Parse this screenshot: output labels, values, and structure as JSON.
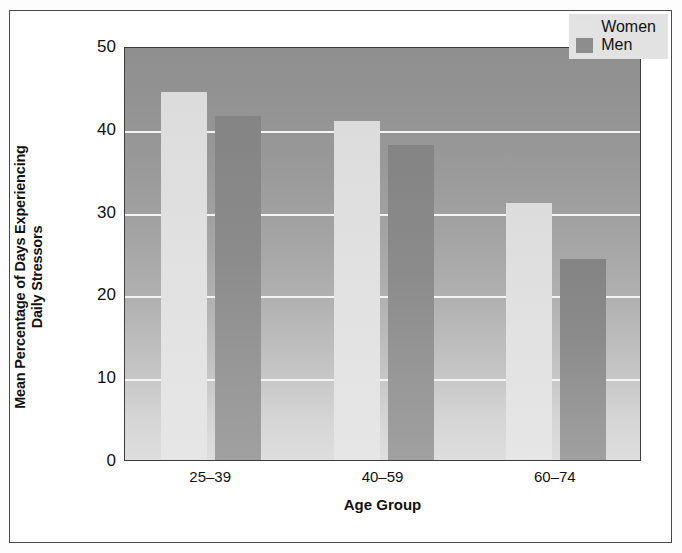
{
  "chart_data": {
    "type": "bar",
    "title": "",
    "xlabel": "Age Group",
    "ylabel_line1": "Mean Percentage of Days Experiencing",
    "ylabel_line2": "Daily Stressors",
    "categories": [
      "25–39",
      "40–59",
      "60–74"
    ],
    "series": [
      {
        "name": "Women",
        "values": [
          44.5,
          41.0,
          31.0
        ],
        "color": "#e2e2e2"
      },
      {
        "name": "Men",
        "values": [
          41.5,
          38.0,
          24.3
        ],
        "color": "#8d8d8d"
      }
    ],
    "ylim": [
      0,
      50
    ],
    "yticks": [
      0,
      10,
      20,
      30,
      40,
      50
    ],
    "ytick_labels": [
      "0",
      "10",
      "20",
      "30",
      "40",
      "50"
    ],
    "gridlines": [
      10,
      20,
      30,
      40
    ],
    "grid": true,
    "grid_color": "#f4f4f4",
    "legend_position": "top-right",
    "plot_background": "vertical gradient dark-gray to light-gray",
    "frame_color": "#3c3c3c"
  },
  "legend": {
    "entries": [
      {
        "label": "Women",
        "swatch": "legend-swatch-women"
      },
      {
        "label": "Men",
        "swatch": "legend-swatch-men"
      }
    ]
  }
}
